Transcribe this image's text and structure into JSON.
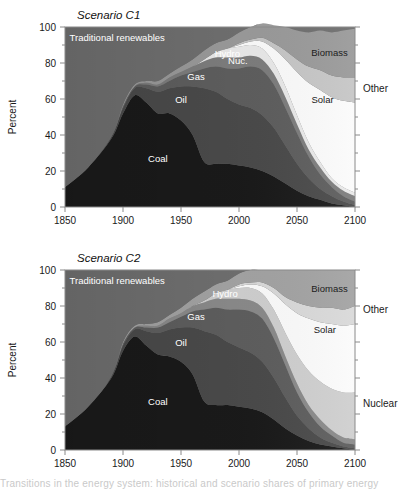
{
  "figure": {
    "caption_fragment": "Transitions in the energy system: historical and scenario shares of primary energy"
  },
  "panels": [
    {
      "id": "c1",
      "title": "Scenario C1",
      "y_axis_title": "Percent",
      "y_ticks": [
        0,
        20,
        40,
        60,
        80,
        100
      ],
      "x_ticks": [
        1850,
        1900,
        1950,
        2000,
        2050,
        2100
      ],
      "inner_labels": [
        {
          "name": "traditional-renewables",
          "text": "Traditional renewables",
          "x": 1895,
          "y": 92.5,
          "color": "white"
        },
        {
          "name": "coal",
          "text": "Coal",
          "x": 1930,
          "y": 25,
          "color": "white"
        },
        {
          "name": "oil",
          "text": "Oil",
          "x": 1950,
          "y": 58,
          "color": "white"
        },
        {
          "name": "gas",
          "text": "Gas",
          "x": 1963,
          "y": 70.5,
          "color": "white"
        },
        {
          "name": "hydro",
          "text": "Hydro",
          "x": 1990,
          "y": 83.5,
          "color": "white"
        },
        {
          "name": "nuclear",
          "text": "Nuc.",
          "x": 1999,
          "y": 79.5,
          "color": "white"
        },
        {
          "name": "biomass",
          "text": "Biomass",
          "x": 2078,
          "y": 84,
          "color": "dark"
        },
        {
          "name": "solar",
          "text": "Solar",
          "x": 2072,
          "y": 58,
          "color": "dark"
        }
      ],
      "outside_labels": [
        {
          "name": "other",
          "text": "Other",
          "y": 66
        }
      ]
    },
    {
      "id": "c2",
      "title": "Scenario C2",
      "y_axis_title": "Percent",
      "y_ticks": [
        0,
        20,
        40,
        60,
        80,
        100
      ],
      "x_ticks": [
        1850,
        1900,
        1950,
        2000,
        2050,
        2100
      ],
      "inner_labels": [
        {
          "name": "traditional-renewables",
          "text": "Traditional renewables",
          "x": 1895,
          "y": 92.5,
          "color": "white"
        },
        {
          "name": "coal",
          "text": "Coal",
          "x": 1930,
          "y": 25,
          "color": "white"
        },
        {
          "name": "oil",
          "text": "Oil",
          "x": 1950,
          "y": 58,
          "color": "white"
        },
        {
          "name": "gas",
          "text": "Gas",
          "x": 1963,
          "y": 72,
          "color": "white"
        },
        {
          "name": "hydro",
          "text": "Hydro",
          "x": 1988,
          "y": 85,
          "color": "white"
        },
        {
          "name": "biomass",
          "text": "Biomass",
          "x": 2078,
          "y": 88,
          "color": "dark"
        },
        {
          "name": "solar",
          "text": "Solar",
          "x": 2074,
          "y": 65,
          "color": "dark"
        }
      ],
      "outside_labels": [
        {
          "name": "other",
          "text": "Other",
          "y": 78
        },
        {
          "name": "nuclear",
          "text": "Nuclear",
          "y": 26
        }
      ]
    }
  ],
  "chart_data": [
    {
      "type": "area",
      "chart_id": "c1",
      "title": "Scenario C1",
      "xlabel": "",
      "ylabel": "Percent",
      "xlim": [
        1850,
        2100
      ],
      "ylim": [
        0,
        100
      ],
      "grid": false,
      "stacked": true,
      "normalized": true,
      "legend_position": "inline-labels",
      "x": [
        1850,
        1870,
        1890,
        1900,
        1910,
        1920,
        1930,
        1940,
        1950,
        1960,
        1970,
        1980,
        1990,
        2000,
        2010,
        2020,
        2030,
        2040,
        2050,
        2060,
        2070,
        2080,
        2090,
        2100
      ],
      "series": [
        {
          "name": "Coal",
          "color": "#1a1a1a",
          "values": [
            11,
            22,
            38,
            52,
            62,
            58,
            52,
            52,
            48,
            40,
            25,
            24,
            24,
            23,
            22,
            20,
            17,
            13,
            9,
            6,
            4,
            2,
            1,
            0
          ]
        },
        {
          "name": "Oil",
          "color": "#4a4a4a",
          "values": [
            0,
            0,
            1,
            3,
            4,
            8,
            12,
            14,
            19,
            27,
            41,
            40,
            36,
            34,
            33,
            31,
            27,
            21,
            15,
            10,
            6,
            4,
            2,
            1
          ]
        },
        {
          "name": "Gas",
          "color": "#5e5e5e",
          "values": [
            0,
            0,
            0,
            1,
            1,
            2,
            3,
            4,
            6,
            8,
            11,
            14,
            17,
            20,
            23,
            25,
            24,
            21,
            17,
            12,
            8,
            5,
            3,
            2
          ]
        },
        {
          "name": "Hydro",
          "color": "#7d7d7d",
          "values": [
            0,
            0,
            0,
            0,
            0,
            1,
            1,
            2,
            2,
            3,
            4,
            5,
            6,
            6,
            6,
            6,
            6,
            6,
            5,
            4,
            4,
            3,
            3,
            3
          ]
        },
        {
          "name": "Nuclear",
          "color": "#e9e9e9",
          "values": [
            0,
            0,
            0,
            0,
            0,
            0,
            0,
            0,
            0,
            0,
            1,
            3,
            5,
            6,
            6,
            6,
            6,
            6,
            5,
            4,
            3,
            2,
            2,
            2
          ]
        },
        {
          "name": "Solar",
          "color": "#fbfbfb",
          "values": [
            0,
            0,
            0,
            0,
            0,
            0,
            0,
            0,
            0,
            0,
            0,
            0,
            0,
            1,
            2,
            4,
            8,
            15,
            24,
            33,
            40,
            45,
            48,
            50
          ]
        },
        {
          "name": "Other",
          "color": "#c6c6c6",
          "values": [
            0,
            0,
            0,
            0,
            0,
            0,
            0,
            0,
            0,
            0,
            0,
            0,
            0,
            1,
            1,
            2,
            3,
            5,
            7,
            9,
            11,
            12,
            13,
            14
          ]
        },
        {
          "name": "Biomass",
          "color": "#9a9a9a",
          "values": [
            0,
            0,
            0,
            1,
            1,
            1,
            2,
            2,
            3,
            4,
            5,
            5,
            5,
            6,
            7,
            8,
            10,
            13,
            16,
            19,
            22,
            24,
            26,
            27
          ]
        },
        {
          "name": "Traditional renewables",
          "color": "#6f6f6f",
          "values": [
            89,
            78,
            61,
            43,
            32,
            30,
            30,
            26,
            22,
            18,
            13,
            9,
            7,
            3,
            0,
            0,
            0,
            0,
            0,
            0,
            0,
            0,
            0,
            0
          ]
        }
      ]
    },
    {
      "type": "area",
      "chart_id": "c2",
      "title": "Scenario C2",
      "xlabel": "",
      "ylabel": "Percent",
      "xlim": [
        1850,
        2100
      ],
      "ylim": [
        0,
        100
      ],
      "grid": false,
      "stacked": true,
      "normalized": true,
      "legend_position": "inline-labels",
      "x": [
        1850,
        1870,
        1890,
        1900,
        1910,
        1920,
        1930,
        1940,
        1950,
        1960,
        1970,
        1980,
        1990,
        2000,
        2010,
        2020,
        2030,
        2040,
        2050,
        2060,
        2070,
        2080,
        2090,
        2100
      ],
      "series": [
        {
          "name": "Coal",
          "color": "#1a1a1a",
          "values": [
            13,
            24,
            40,
            55,
            63,
            58,
            53,
            52,
            49,
            42,
            27,
            25,
            25,
            24,
            23,
            21,
            17,
            12,
            8,
            5,
            3,
            2,
            1,
            0
          ]
        },
        {
          "name": "Oil",
          "color": "#4a4a4a",
          "values": [
            0,
            0,
            1,
            3,
            4,
            8,
            12,
            15,
            19,
            26,
            39,
            39,
            35,
            33,
            31,
            28,
            23,
            17,
            11,
            7,
            4,
            2,
            1,
            1
          ]
        },
        {
          "name": "Gas",
          "color": "#5e5e5e",
          "values": [
            0,
            0,
            0,
            1,
            1,
            2,
            3,
            4,
            6,
            9,
            12,
            15,
            18,
            21,
            23,
            24,
            22,
            18,
            13,
            9,
            6,
            4,
            2,
            2
          ]
        },
        {
          "name": "Hydro",
          "color": "#8a8a8a",
          "values": [
            0,
            0,
            0,
            0,
            0,
            1,
            1,
            2,
            2,
            3,
            4,
            5,
            6,
            6,
            6,
            6,
            6,
            5,
            5,
            4,
            4,
            3,
            3,
            3
          ]
        },
        {
          "name": "Nuclear",
          "color": "#cfcfcf",
          "values": [
            0,
            0,
            0,
            0,
            0,
            0,
            0,
            0,
            0,
            0,
            1,
            3,
            5,
            6,
            7,
            8,
            10,
            13,
            16,
            19,
            21,
            23,
            25,
            26
          ]
        },
        {
          "name": "Solar",
          "color": "#fbfbfb",
          "values": [
            0,
            0,
            0,
            0,
            0,
            0,
            0,
            0,
            0,
            0,
            0,
            0,
            0,
            1,
            2,
            4,
            9,
            16,
            23,
            29,
            33,
            36,
            37,
            38
          ]
        },
        {
          "name": "Other",
          "color": "#d9d9d9",
          "values": [
            0,
            0,
            0,
            0,
            0,
            0,
            0,
            0,
            0,
            0,
            0,
            0,
            0,
            1,
            1,
            2,
            3,
            4,
            6,
            7,
            8,
            9,
            9,
            10
          ]
        },
        {
          "name": "Biomass",
          "color": "#a3a3a3",
          "values": [
            0,
            0,
            0,
            1,
            1,
            1,
            2,
            2,
            3,
            4,
            5,
            5,
            5,
            6,
            7,
            7,
            10,
            15,
            18,
            20,
            21,
            21,
            22,
            20
          ]
        },
        {
          "name": "Traditional renewables",
          "color": "#6f6f6f",
          "values": [
            87,
            76,
            59,
            40,
            31,
            30,
            29,
            25,
            21,
            16,
            12,
            8,
            6,
            2,
            0,
            0,
            0,
            0,
            0,
            0,
            0,
            0,
            0,
            0
          ]
        }
      ]
    }
  ]
}
